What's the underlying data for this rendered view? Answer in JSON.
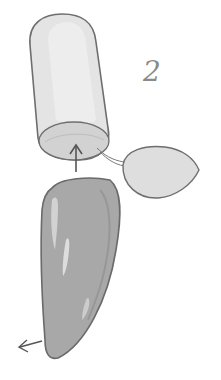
{
  "illustration": {
    "step_number": "2",
    "parts": {
      "tube": "cylinder-shape",
      "cap": "oval-shape",
      "pepper": "elongated-tapered-shape"
    },
    "colors": {
      "outline": "#6e6e6e",
      "tube_fill": "#e4e4e4",
      "tube_highlight": "#ededed",
      "tube_end": "#cfcfcf",
      "cap_fill": "#dedede",
      "pepper_fill": "#a8a8a8",
      "pepper_highlight": "#dcdcdc",
      "arrow": "#555555"
    }
  }
}
